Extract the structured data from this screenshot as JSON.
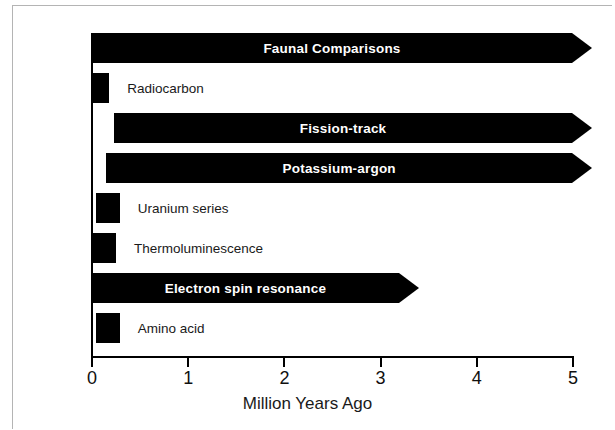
{
  "chart_data": {
    "type": "bar",
    "orientation": "horizontal",
    "title": "",
    "xlabel": "Million Years Ago",
    "ylabel": "",
    "xlim": [
      0,
      5
    ],
    "xticks": [
      0,
      1,
      2,
      3,
      4,
      5
    ],
    "xtick_labels": [
      "0",
      "1",
      "2",
      "3",
      "4",
      "5"
    ],
    "grid": false,
    "legend": "none",
    "note": "Horizontal range bars showing the applicable dating span of archaeological dating methods. Bars ending in an arrowhead at the right edge extend beyond the 5 Ma axis limit.",
    "categories": [
      "Faunal Comparisons",
      "Radiocarbon",
      "Fission-track",
      "Potassium-argon",
      "Uranium series",
      "Thermoluminescence",
      "Electron spin resonance",
      "Amino acid"
    ],
    "bars": [
      {
        "label": "Faunal Comparisons",
        "start": 0.01,
        "end": 5.0,
        "open_ended": true,
        "label_inside": true,
        "label_bold": true,
        "label_color": "#ffffff"
      },
      {
        "label": "Radiocarbon",
        "start": 0.02,
        "end": 0.19,
        "open_ended": false,
        "label_inside": false,
        "label_bold": false,
        "label_color": "#1a1a1a"
      },
      {
        "label": "Fission-track",
        "start": 0.24,
        "end": 5.0,
        "open_ended": true,
        "label_inside": true,
        "label_bold": true,
        "label_color": "#ffffff"
      },
      {
        "label": "Potassium-argon",
        "start": 0.16,
        "end": 5.0,
        "open_ended": true,
        "label_inside": true,
        "label_bold": true,
        "label_color": "#ffffff"
      },
      {
        "label": "Uranium series",
        "start": 0.05,
        "end": 0.3,
        "open_ended": false,
        "label_inside": false,
        "label_bold": false,
        "label_color": "#1a1a1a"
      },
      {
        "label": "Thermoluminescence",
        "start": 0.01,
        "end": 0.26,
        "open_ended": false,
        "label_inside": false,
        "label_bold": false,
        "label_color": "#1a1a1a"
      },
      {
        "label": "Electron spin resonance",
        "start": 0.01,
        "end": 3.2,
        "open_ended": true,
        "label_inside": true,
        "label_bold": true,
        "label_color": "#ffffff"
      },
      {
        "label": "Amino acid",
        "start": 0.05,
        "end": 0.3,
        "open_ended": false,
        "label_inside": false,
        "label_bold": false,
        "label_color": "#1a1a1a"
      }
    ]
  },
  "colors": {
    "bar": "#000000",
    "background": "#ffffff",
    "axis": "#000000",
    "frame": "#b4b4b4",
    "label_outside": "#1a1a1a",
    "label_inside": "#ffffff"
  },
  "axis": {
    "x_title": "Million Years Ago",
    "tick_labels": [
      "0",
      "1",
      "2",
      "3",
      "4",
      "5"
    ]
  }
}
